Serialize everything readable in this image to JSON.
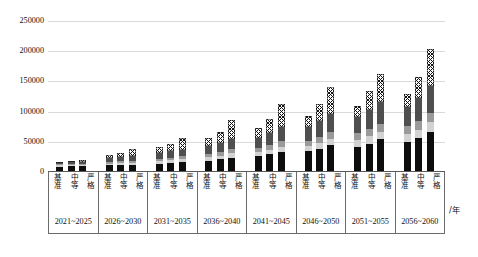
{
  "chart_data": {
    "type": "bar",
    "subtype": "grouped-stacked-bar",
    "title": "",
    "xlabel": "/年",
    "ylabel": "",
    "ylim": [
      0,
      250000
    ],
    "yticks": [
      0,
      50000,
      100000,
      150000,
      200000,
      250000
    ],
    "ytick_labels": [
      "0",
      "50000",
      "100000",
      "150000",
      "200000",
      "250000"
    ],
    "grid": true,
    "legend": "none",
    "categories": [
      "2021~2025",
      "2026~2030",
      "2031~2035",
      "2036~2040",
      "2041~2045",
      "2046~2050",
      "2051~2055",
      "2056~2060"
    ],
    "scenarios": [
      "基准",
      "中等",
      "严格"
    ],
    "stack_segments": [
      {
        "name": "segment-1",
        "style": "black",
        "color": "#0d0d0d"
      },
      {
        "name": "segment-2",
        "style": "light-gray",
        "color": "#d2d2d2"
      },
      {
        "name": "segment-3",
        "style": "mid-gray",
        "color": "#9a9a9a"
      },
      {
        "name": "segment-4",
        "style": "dark",
        "color": "#0d0d0d"
      },
      {
        "name": "segment-5",
        "style": "cross-hatch",
        "color": "#ffffff"
      }
    ],
    "bars": [
      {
        "group": "2021~2025",
        "scenario": "基准",
        "total": 17000,
        "stack": [
          9000,
          2000,
          1500,
          2500,
          2000
        ]
      },
      {
        "group": "2021~2025",
        "scenario": "中等",
        "total": 18500,
        "stack": [
          9500,
          2000,
          1500,
          3000,
          2500
        ]
      },
      {
        "group": "2021~2025",
        "scenario": "严格",
        "total": 20500,
        "stack": [
          10000,
          2000,
          1500,
          3000,
          4000
        ]
      },
      {
        "group": "2026~2030",
        "scenario": "基准",
        "total": 28000,
        "stack": [
          11000,
          3000,
          3000,
          6000,
          5000
        ]
      },
      {
        "group": "2026~2030",
        "scenario": "中等",
        "total": 31000,
        "stack": [
          11500,
          3000,
          3500,
          6500,
          6500
        ]
      },
      {
        "group": "2026~2030",
        "scenario": "严格",
        "total": 38000,
        "stack": [
          12000,
          3500,
          3500,
          7000,
          12000
        ]
      },
      {
        "group": "2031~2035",
        "scenario": "基准",
        "total": 42000,
        "stack": [
          14000,
          4000,
          4000,
          9000,
          11000
        ]
      },
      {
        "group": "2031~2035",
        "scenario": "中等",
        "total": 46000,
        "stack": [
          15000,
          4500,
          4500,
          10000,
          12000
        ]
      },
      {
        "group": "2031~2035",
        "scenario": "严格",
        "total": 56000,
        "stack": [
          16000,
          5000,
          5000,
          11000,
          19000
        ]
      },
      {
        "group": "2036~2040",
        "scenario": "基准",
        "total": 57000,
        "stack": [
          19000,
          5500,
          5500,
          13000,
          14000
        ]
      },
      {
        "group": "2036~2040",
        "scenario": "中等",
        "total": 66000,
        "stack": [
          21000,
          6000,
          6000,
          15000,
          18000
        ]
      },
      {
        "group": "2036~2040",
        "scenario": "严格",
        "total": 86000,
        "stack": [
          24000,
          7000,
          7000,
          17000,
          31000
        ]
      },
      {
        "group": "2041~2045",
        "scenario": "基准",
        "total": 73000,
        "stack": [
          26000,
          7000,
          7000,
          17000,
          16000
        ]
      },
      {
        "group": "2041~2045",
        "scenario": "中等",
        "total": 88000,
        "stack": [
          29000,
          8000,
          8000,
          20000,
          23000
        ]
      },
      {
        "group": "2041~2045",
        "scenario": "严格",
        "total": 112000,
        "stack": [
          33000,
          9000,
          9000,
          23000,
          38000
        ]
      },
      {
        "group": "2046~2050",
        "scenario": "基准",
        "total": 92000,
        "stack": [
          34000,
          9000,
          9000,
          22000,
          18000
        ]
      },
      {
        "group": "2046~2050",
        "scenario": "中等",
        "total": 112000,
        "stack": [
          38000,
          10000,
          10000,
          26000,
          28000
        ]
      },
      {
        "group": "2046~2050",
        "scenario": "严格",
        "total": 141000,
        "stack": [
          44000,
          11000,
          11000,
          30000,
          45000
        ]
      },
      {
        "group": "2051~2055",
        "scenario": "基准",
        "total": 110000,
        "stack": [
          42000,
          11000,
          11000,
          27000,
          19000
        ]
      },
      {
        "group": "2051~2055",
        "scenario": "中等",
        "total": 134000,
        "stack": [
          47000,
          12000,
          12000,
          32000,
          31000
        ]
      },
      {
        "group": "2051~2055",
        "scenario": "严格",
        "total": 163000,
        "stack": [
          54000,
          13000,
          13000,
          36000,
          47000
        ]
      },
      {
        "group": "2056~2060",
        "scenario": "基准",
        "total": 130000,
        "stack": [
          50000,
          13000,
          13000,
          32000,
          22000
        ]
      },
      {
        "group": "2056~2060",
        "scenario": "中等",
        "total": 157000,
        "stack": [
          56000,
          14000,
          14000,
          38000,
          35000
        ]
      },
      {
        "group": "2056~2060",
        "scenario": "严格",
        "total": 203000,
        "stack": [
          66000,
          16000,
          16000,
          45000,
          60000
        ]
      }
    ]
  }
}
